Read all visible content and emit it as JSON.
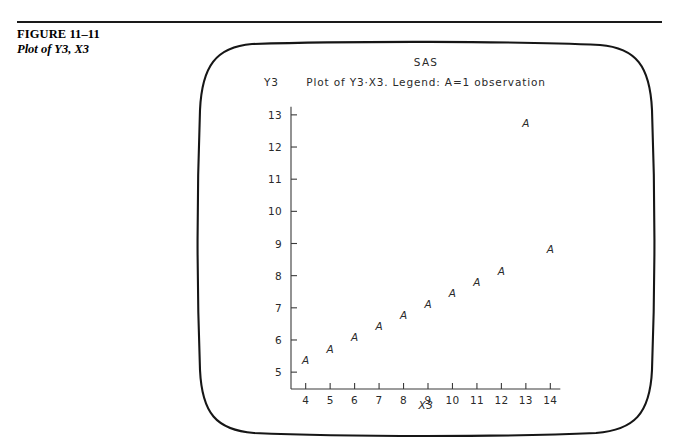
{
  "figure": {
    "number": "FIGURE 11–11",
    "title": "Plot of Y3, X3"
  },
  "terminal": {
    "system_header": "SAS",
    "plot_title": "Plot of Y3·X3. Legend: A=1 observation",
    "y_axis_name": "Y3",
    "x_axis_name": "X3"
  },
  "chart_data": {
    "type": "scatter",
    "xlabel": "X3",
    "ylabel": "Y3",
    "xlim": [
      3.4,
      14.6
    ],
    "ylim": [
      4.6,
      13.4
    ],
    "xticks": [
      4,
      5,
      6,
      7,
      8,
      9,
      10,
      11,
      12,
      13,
      14
    ],
    "yticks": [
      5,
      6,
      7,
      8,
      9,
      10,
      11,
      12,
      13
    ],
    "xtick_labels": [
      "4",
      "5",
      "6",
      "7",
      "8",
      "9",
      "10",
      "11",
      "12",
      "13",
      "14"
    ],
    "ytick_labels": [
      "5",
      "6",
      "7",
      "8",
      "9",
      "10",
      "11",
      "12",
      "13"
    ],
    "grid": false,
    "legend": "A=1 observation",
    "marker": "A",
    "series": [
      {
        "name": "Y3 vs X3",
        "points": [
          {
            "x": 4,
            "y": 5.39,
            "label": "A"
          },
          {
            "x": 5,
            "y": 5.73,
            "label": "A"
          },
          {
            "x": 6,
            "y": 6.08,
            "label": "A"
          },
          {
            "x": 7,
            "y": 6.42,
            "label": "A"
          },
          {
            "x": 8,
            "y": 6.77,
            "label": "A"
          },
          {
            "x": 9,
            "y": 7.11,
            "label": "A"
          },
          {
            "x": 10,
            "y": 7.46,
            "label": "A"
          },
          {
            "x": 11,
            "y": 7.81,
            "label": "A"
          },
          {
            "x": 12,
            "y": 8.15,
            "label": "A"
          },
          {
            "x": 13,
            "y": 12.74,
            "label": "A"
          },
          {
            "x": 14,
            "y": 8.84,
            "label": "A"
          }
        ]
      }
    ]
  }
}
